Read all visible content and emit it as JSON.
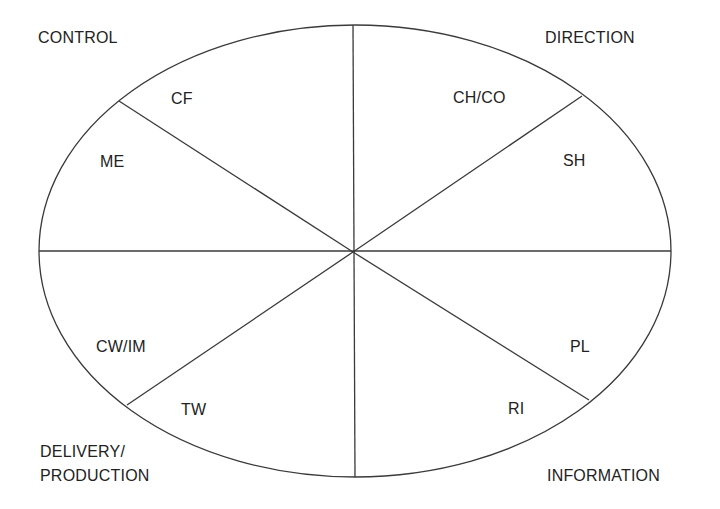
{
  "diagram": {
    "type": "segmented-ellipse",
    "stroke_color": "#3a3a3a",
    "background": "#ffffff",
    "quadrant_labels": {
      "top_left": "CONTROL",
      "top_right": "DIRECTION",
      "bottom_left_line1": "DELIVERY/",
      "bottom_left_line2": "PRODUCTION",
      "bottom_right": "INFORMATION"
    },
    "segments": [
      {
        "label": "CF",
        "quadrant": "CONTROL"
      },
      {
        "label": "ME",
        "quadrant": "CONTROL"
      },
      {
        "label": "CH/CO",
        "quadrant": "DIRECTION"
      },
      {
        "label": "SH",
        "quadrant": "DIRECTION"
      },
      {
        "label": "CW/IM",
        "quadrant": "DELIVERY/PRODUCTION"
      },
      {
        "label": "TW",
        "quadrant": "DELIVERY/PRODUCTION"
      },
      {
        "label": "RI",
        "quadrant": "INFORMATION"
      },
      {
        "label": "PL",
        "quadrant": "INFORMATION"
      }
    ]
  }
}
